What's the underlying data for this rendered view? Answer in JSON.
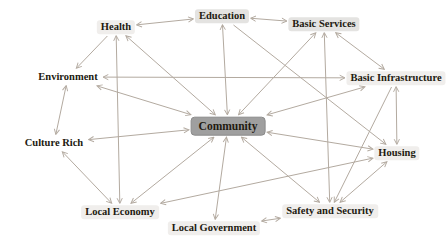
{
  "figure": {
    "type": "network-diagram",
    "description_title": "Community concept network",
    "background": "#ffffff"
  },
  "colors": {
    "edge": "#b3aaa0",
    "node_text": "#221a10",
    "hub_fill": "#9f9f9f",
    "hub_border": "#8b8b8b",
    "label_bg_gray": "#e4e3e1",
    "label_bg_faint": "#f0eeec"
  },
  "diagram": {
    "nodes": [
      {
        "id": "health",
        "label": "Health",
        "x": 116,
        "y": 27,
        "style": "faint"
      },
      {
        "id": "education",
        "label": "Education",
        "x": 222,
        "y": 16,
        "style": "gray"
      },
      {
        "id": "basic-services",
        "label": "Basic Services",
        "x": 324,
        "y": 24,
        "style": "gray"
      },
      {
        "id": "environment",
        "label": "Environment",
        "x": 68,
        "y": 77,
        "style": "none"
      },
      {
        "id": "basic-infrastructure",
        "label": "Basic Infrastructure",
        "x": 396,
        "y": 78,
        "style": "faint"
      },
      {
        "id": "culture-rich",
        "label": "Culture Rich",
        "x": 54,
        "y": 143,
        "style": "none"
      },
      {
        "id": "community",
        "label": "Community",
        "x": 228,
        "y": 126,
        "style": "hub"
      },
      {
        "id": "housing",
        "label": "Housing",
        "x": 397,
        "y": 153,
        "style": "faint"
      },
      {
        "id": "local-economy",
        "label": "Local Economy",
        "x": 120,
        "y": 212,
        "style": "faint"
      },
      {
        "id": "local-government",
        "label": "Local Government",
        "x": 214,
        "y": 228,
        "style": "faint"
      },
      {
        "id": "safety-and-security",
        "label": "Safety and Security",
        "x": 330,
        "y": 211,
        "style": "faint"
      }
    ],
    "edges": [
      {
        "from": "community",
        "to": "health",
        "dir": "both"
      },
      {
        "from": "community",
        "to": "education",
        "dir": "both"
      },
      {
        "from": "community",
        "to": "basic-services",
        "dir": "both"
      },
      {
        "from": "community",
        "to": "basic-infrastructure",
        "dir": "both"
      },
      {
        "from": "community",
        "to": "environment",
        "dir": "both"
      },
      {
        "from": "community",
        "to": "culture-rich",
        "dir": "both"
      },
      {
        "from": "community",
        "to": "local-economy",
        "dir": "both"
      },
      {
        "from": "community",
        "to": "local-government",
        "dir": "both"
      },
      {
        "from": "community",
        "to": "safety-and-security",
        "dir": "both"
      },
      {
        "from": "community",
        "to": "housing",
        "dir": "both"
      },
      {
        "from": "health",
        "to": "education",
        "dir": "both"
      },
      {
        "from": "education",
        "to": "basic-services",
        "dir": "both"
      },
      {
        "from": "basic-services",
        "to": "basic-infrastructure",
        "dir": "both"
      },
      {
        "from": "environment",
        "to": "basic-infrastructure",
        "dir": "both"
      },
      {
        "from": "health",
        "to": "environment",
        "dir": "forward"
      },
      {
        "from": "environment",
        "to": "culture-rich",
        "dir": "both"
      },
      {
        "from": "culture-rich",
        "to": "local-economy",
        "dir": "both"
      },
      {
        "from": "health",
        "to": "local-economy",
        "dir": "both"
      },
      {
        "from": "basic-services",
        "to": "safety-and-security",
        "dir": "both"
      },
      {
        "from": "basic-infrastructure",
        "to": "housing",
        "dir": "both"
      },
      {
        "from": "basic-infrastructure",
        "to": "safety-and-security",
        "dir": "forward"
      },
      {
        "from": "safety-and-security",
        "to": "housing",
        "dir": "both"
      },
      {
        "from": "local-government",
        "to": "safety-and-security",
        "dir": "both"
      },
      {
        "from": "local-economy",
        "to": "housing",
        "dir": "both"
      },
      {
        "from": "education",
        "to": "housing",
        "dir": "forward"
      }
    ]
  }
}
